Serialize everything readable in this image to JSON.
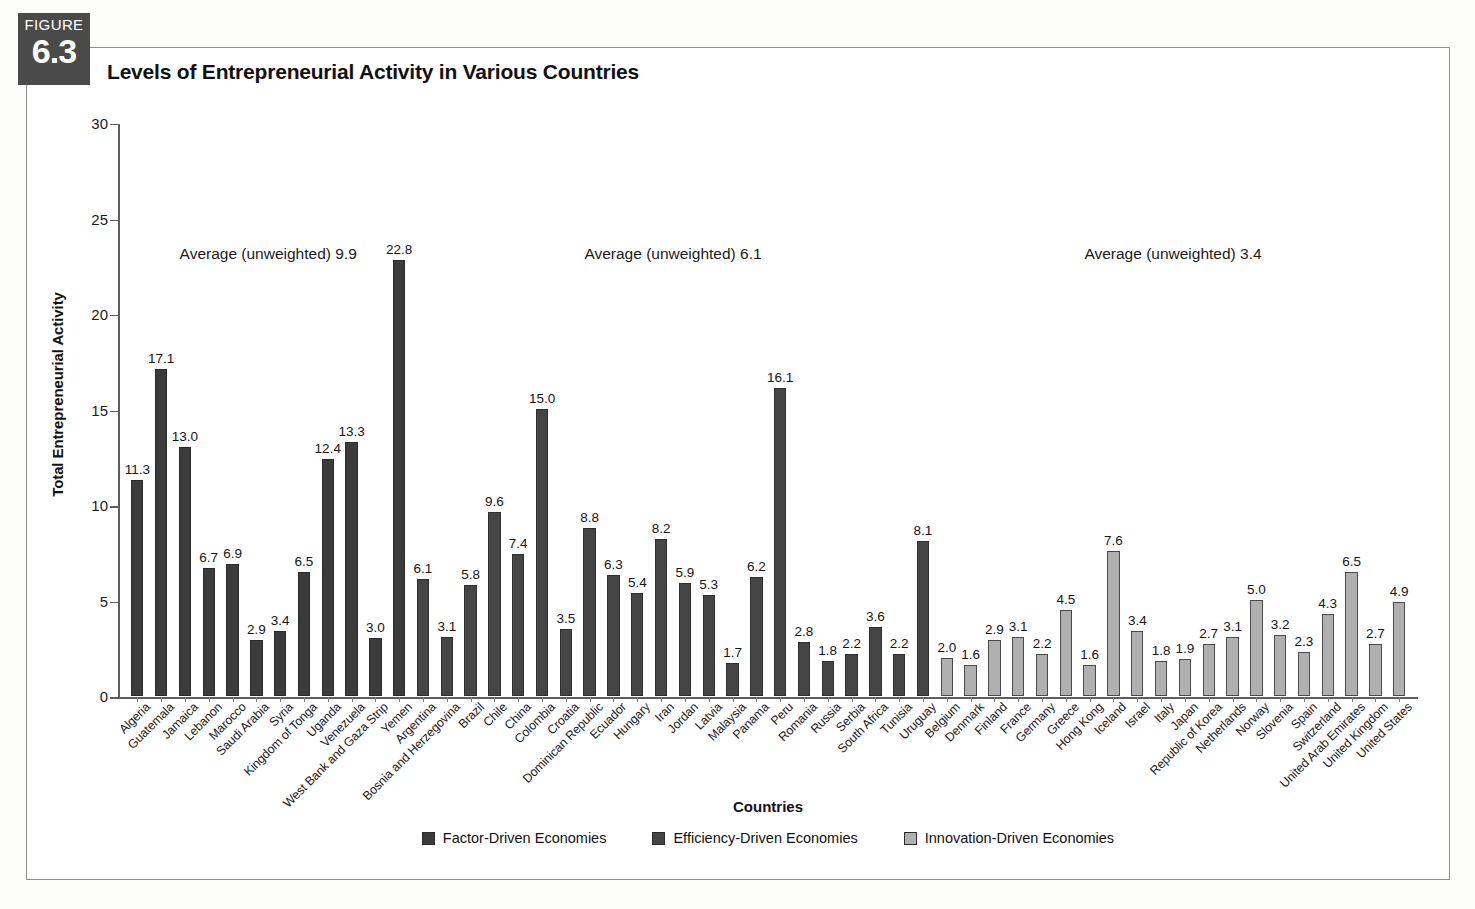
{
  "figure": {
    "badge_word": "FIGURE",
    "badge_number": "6.3",
    "title": "Levels of Entrepreneurial Activity in Various Countries"
  },
  "axes": {
    "y_label": "Total Entrepreneurial Activity",
    "x_label": "Countries",
    "y_ticks": [
      "0",
      "5",
      "10",
      "15",
      "20",
      "25",
      "30"
    ]
  },
  "annotations": [
    {
      "name": "average-factor",
      "text": "Average (unweighted) 9.9"
    },
    {
      "name": "average-efficiency",
      "text": "Average (unweighted) 6.1"
    },
    {
      "name": "average-innovation",
      "text": "Average (unweighted) 3.4"
    }
  ],
  "legend": [
    {
      "label": "Factor-Driven Economies",
      "color": "#3b3b3b",
      "key": "factor"
    },
    {
      "label": "Efficiency-Driven Economies",
      "color": "#454545",
      "key": "efficiency"
    },
    {
      "label": "Innovation-Driven Economies",
      "color": "#b0b0b0",
      "key": "innovation"
    }
  ],
  "chart_data": {
    "type": "bar",
    "title": "Levels of Entrepreneurial Activity in Various Countries",
    "xlabel": "Countries",
    "ylabel": "Total Entrepreneurial Activity",
    "ylim": [
      0,
      30
    ],
    "ytick_step": 5,
    "grid": false,
    "legend_position": "bottom-center",
    "value_labels": true,
    "categories": [
      "Algeria",
      "Guatemala",
      "Jamaica",
      "Lebanon",
      "Marocco",
      "Saudi Arabia",
      "Syria",
      "Kingdom of Tonga",
      "Uganda",
      "Venezuela",
      "West Bank and Gaza Strip",
      "Yemen",
      "Argentina",
      "Bosnia and Herzegovina",
      "Brazil",
      "Chile",
      "China",
      "Colombia",
      "Croatia",
      "Dominican Republic",
      "Ecuador",
      "Hungary",
      "Iran",
      "Jordan",
      "Latvia",
      "Malaysia",
      "Panama",
      "Peru",
      "Romania",
      "Russia",
      "Serbia",
      "South Africa",
      "Tunisia",
      "Uruguay",
      "Belgium",
      "Denmark",
      "Finland",
      "France",
      "Germany",
      "Greece",
      "Hong Kong",
      "Iceland",
      "Israel",
      "Italy",
      "Japan",
      "Republic of Korea",
      "Netherlands",
      "Norway",
      "Slovenia",
      "Spain",
      "Switzerland",
      "United Arab Emirates",
      "United Kingdom",
      "United States"
    ],
    "values": [
      11.3,
      17.1,
      13.0,
      6.7,
      6.9,
      2.9,
      3.4,
      6.5,
      12.4,
      13.3,
      3.0,
      22.8,
      6.1,
      3.1,
      5.8,
      9.6,
      7.4,
      15.0,
      3.5,
      8.8,
      6.3,
      5.4,
      8.2,
      5.9,
      5.3,
      1.7,
      6.2,
      16.1,
      2.8,
      1.8,
      2.2,
      3.6,
      2.2,
      8.1,
      2.0,
      1.6,
      2.9,
      3.1,
      2.2,
      4.5,
      1.6,
      7.6,
      3.4,
      1.8,
      1.9,
      2.7,
      3.1,
      5.0,
      3.2,
      2.3,
      4.3,
      6.5,
      2.7,
      4.9
    ],
    "groups": [
      {
        "name": "Factor-Driven Economies",
        "key": "factor",
        "start": 0,
        "end": 11,
        "average_unweighted": 9.9
      },
      {
        "name": "Efficiency-Driven Economies",
        "key": "efficiency",
        "start": 12,
        "end": 33,
        "average_unweighted": 6.1
      },
      {
        "name": "Innovation-Driven Economies",
        "key": "innovation",
        "start": 34,
        "end": 53,
        "average_unweighted": 3.4
      }
    ]
  }
}
